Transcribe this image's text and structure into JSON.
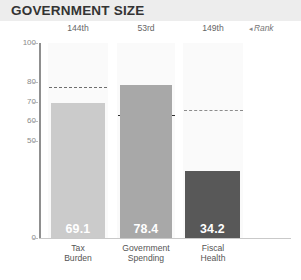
{
  "header": {
    "title": "GOVERNMENT SIZE"
  },
  "rank_note": {
    "caret": "◂",
    "label": "Rank"
  },
  "chart_data": {
    "type": "bar",
    "title": "GOVERNMENT SIZE",
    "xlabel": "",
    "ylabel": "",
    "ylim": [
      0,
      100
    ],
    "grid": false,
    "legend": "none",
    "categories": [
      "Tax Burden",
      "Government Spending",
      "Fiscal Health"
    ],
    "category_lines": [
      [
        "Tax",
        "Burden"
      ],
      [
        "Government",
        "Spending"
      ],
      [
        "Fiscal",
        "Health"
      ]
    ],
    "values": [
      69.1,
      78.4,
      34.2
    ],
    "value_labels": [
      "69.1",
      "78.4",
      "34.2"
    ],
    "ranks": [
      "144th",
      "53rd",
      "149th"
    ],
    "reference_values": [
      77.5,
      63.0,
      65.5
    ],
    "reference_style": "dashed",
    "ytick_labels": [
      "100",
      "80",
      "70",
      "60",
      "50",
      "0"
    ],
    "ytick_values": [
      100,
      80,
      70,
      60,
      50,
      0
    ],
    "bar_colors": [
      "#cbcbcb",
      "#a8a8a8",
      "#585858"
    ],
    "colors": {
      "header_bg": "#ededed",
      "column_bg": "#fafafa",
      "axis": "#8f8f8f",
      "value_text": "#ffffff",
      "title_text": "#333333"
    }
  }
}
